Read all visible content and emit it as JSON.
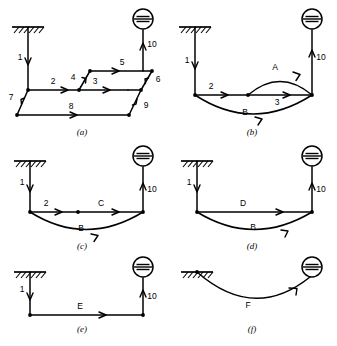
{
  "figure": {
    "title": "",
    "background_color": "#ffffff",
    "line_color": "#000000",
    "panel_count": 6
  },
  "symbols": {
    "tank": "fluid-reservoir-circle-icon",
    "ground": "fixed-ground-hatch-icon",
    "node": "junction-node-dot",
    "arrow": "flow-direction-arrowhead"
  },
  "panels": [
    {
      "id": "a",
      "caption": "(a)",
      "edge_labels": [
        "1",
        "2",
        "3",
        "4",
        "5",
        "6",
        "7",
        "8",
        "9",
        "10"
      ]
    },
    {
      "id": "b",
      "caption": "(b)",
      "edge_labels": [
        "1",
        "2",
        "3",
        "A",
        "B",
        "10"
      ]
    },
    {
      "id": "c",
      "caption": "(c)",
      "edge_labels": [
        "1",
        "2",
        "C",
        "B",
        "10"
      ]
    },
    {
      "id": "d",
      "caption": "(d)",
      "edge_labels": [
        "1",
        "D",
        "B",
        "10"
      ]
    },
    {
      "id": "e",
      "caption": "(e)",
      "edge_labels": [
        "1",
        "E",
        "10"
      ]
    },
    {
      "id": "f",
      "caption": "(f)",
      "edge_labels": [
        "F"
      ]
    }
  ],
  "labels": {
    "a_1": "1",
    "a_2": "2",
    "a_3": "3",
    "a_4": "4",
    "a_5": "5",
    "a_6": "6",
    "a_7": "7",
    "a_8": "8",
    "a_9": "9",
    "a_10": "10",
    "a_caption": "(a)",
    "b_1": "1",
    "b_2": "2",
    "b_3": "3",
    "b_A": "A",
    "b_B": "B",
    "b_10": "10",
    "b_caption": "(b)",
    "c_1": "1",
    "c_2": "2",
    "c_C": "C",
    "c_B": "B",
    "c_10": "10",
    "c_caption": "(c)",
    "d_1": "1",
    "d_D": "D",
    "d_B": "B",
    "d_10": "10",
    "d_caption": "(d)",
    "e_1": "1",
    "e_E": "E",
    "e_10": "10",
    "e_caption": "(e)",
    "f_F": "F",
    "f_caption": "(f)"
  }
}
